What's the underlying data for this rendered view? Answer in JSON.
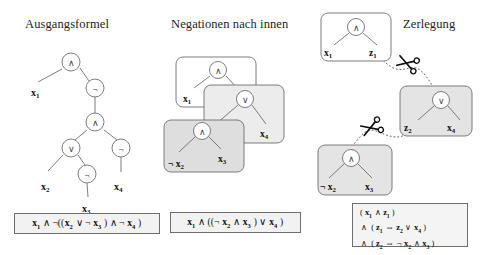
{
  "diagram": {
    "language": "de",
    "kind": "tseitin-transformation-steps"
  },
  "colors": {
    "stroke": "#6e6e6e",
    "text": "#1a1a1a",
    "box_white": "#ffffff",
    "box_light_gray": "#e9e9e9",
    "box_gray": "#dcdcdc",
    "formula_bg": "#f2f2f2",
    "dashed_line": "#555555"
  },
  "panels": [
    {
      "id": "original",
      "title": "Ausgangsformel",
      "tree": {
        "nodes": [
          {
            "id": "n1",
            "symbol": "∧",
            "x": 71,
            "y": 62
          },
          {
            "id": "n2",
            "symbol": "¬",
            "x": 95,
            "y": 88
          },
          {
            "id": "n3",
            "symbol": "∧",
            "x": 95,
            "y": 122
          },
          {
            "id": "n4",
            "symbol": "∨",
            "x": 71,
            "y": 148
          },
          {
            "id": "n5",
            "symbol": "¬",
            "x": 121,
            "y": 148
          },
          {
            "id": "n6",
            "symbol": "¬",
            "x": 87,
            "y": 174
          }
        ],
        "leaves": [
          {
            "label": "x",
            "sub": "1",
            "x": 37,
            "y": 92
          },
          {
            "label": "x",
            "sub": "2",
            "x": 47,
            "y": 186
          },
          {
            "label": "x",
            "sub": "3",
            "x": 83,
            "y": 208
          },
          {
            "label": "x",
            "sub": "4",
            "x": 119,
            "y": 186
          }
        ]
      },
      "formula": {
        "parts": [
          {
            "t": "x",
            "sub": "1"
          },
          {
            "t": " ∧ ¬(("
          },
          {
            "t": "x",
            "sub": "2"
          },
          {
            "t": " ∨ ¬ "
          },
          {
            "t": "x",
            "sub": "3"
          },
          {
            "t": " ) ∧ ¬ "
          },
          {
            "t": "x",
            "sub": "4"
          },
          {
            "t": " )"
          }
        ],
        "text": "x1 ∧ ¬((x2 ∨ ¬ x3 ) ∧ ¬ x4 )"
      }
    },
    {
      "id": "negations",
      "title": "Negationen nach innen",
      "boxes": [
        {
          "id": "box-top",
          "fill": "#ffffff",
          "x": 26,
          "y": 57,
          "w": 80,
          "h": 50
        },
        {
          "id": "box-middle",
          "fill": "#ececec",
          "x": 54,
          "y": 85,
          "w": 80,
          "h": 58
        },
        {
          "id": "box-bottom",
          "fill": "#dedede",
          "x": 14,
          "y": 120,
          "w": 80,
          "h": 52
        }
      ],
      "tree": {
        "nodes": [
          {
            "id": "m1",
            "symbol": "∧",
            "x": 68,
            "y": 70
          },
          {
            "id": "m2",
            "symbol": "∨",
            "x": 95,
            "y": 99
          },
          {
            "id": "m3",
            "symbol": "∧",
            "x": 52,
            "y": 131
          }
        ],
        "leaves": [
          {
            "label": "x",
            "sub": "1",
            "prefix": "",
            "x": 38,
            "y": 98
          },
          {
            "label": "x",
            "sub": "4",
            "prefix": "",
            "x": 115,
            "y": 134
          },
          {
            "label": "x",
            "sub": "2",
            "prefix": "¬",
            "x": 24,
            "y": 163
          },
          {
            "label": "x",
            "sub": "3",
            "prefix": "",
            "x": 72,
            "y": 158
          }
        ]
      },
      "formula": {
        "text": "x1 ∧ ((¬ x2 ∧ x3 ) ∨ x4 )"
      }
    },
    {
      "id": "decomposition",
      "title": "Zerlegung",
      "boxes": [
        {
          "id": "box-z1",
          "fill": "#ffffff",
          "x": 11,
          "y": 13,
          "w": 70,
          "h": 48
        },
        {
          "id": "box-z2",
          "fill": "#e4e4e4",
          "x": 90,
          "y": 86,
          "w": 72,
          "h": 50
        },
        {
          "id": "box-x3",
          "fill": "#e4e4e4",
          "x": 8,
          "y": 145,
          "w": 74,
          "h": 50
        }
      ],
      "tree": {
        "nodes": [
          {
            "id": "d1",
            "symbol": "∧",
            "x": 46,
            "y": 27
          },
          {
            "id": "d2",
            "symbol": "∨",
            "x": 131,
            "y": 100
          },
          {
            "id": "d3",
            "symbol": "∧",
            "x": 41,
            "y": 158
          }
        ],
        "leaves": [
          {
            "label": "x",
            "sub": "1",
            "prefix": "",
            "x": 19,
            "y": 52
          },
          {
            "label": "z",
            "sub": "1",
            "prefix": "",
            "x": 63,
            "y": 52
          },
          {
            "label": "z",
            "sub": "2",
            "prefix": "",
            "x": 98,
            "y": 128
          },
          {
            "label": "x",
            "sub": "4",
            "prefix": "",
            "x": 141,
            "y": 128
          },
          {
            "label": "x",
            "sub": "2",
            "prefix": "¬",
            "x": 13,
            "y": 187
          },
          {
            "label": "x",
            "sub": "3",
            "prefix": "",
            "x": 59,
            "y": 187
          }
        ]
      },
      "scissors": [
        {
          "id": "scissors-upper",
          "x": 96,
          "y": 63,
          "label": "scissors-cut-z1"
        },
        {
          "id": "scissors-lower",
          "x": 60,
          "y": 128,
          "label": "scissors-cut-z2"
        }
      ],
      "formula": {
        "lines": [
          "( x1 ∧ z1 )",
          "∧ ( z1 ⇔ z2 ∨ x4 )",
          "∧ ( z2 ⇔ ¬ x2 ∧ x3 )"
        ]
      }
    }
  ]
}
